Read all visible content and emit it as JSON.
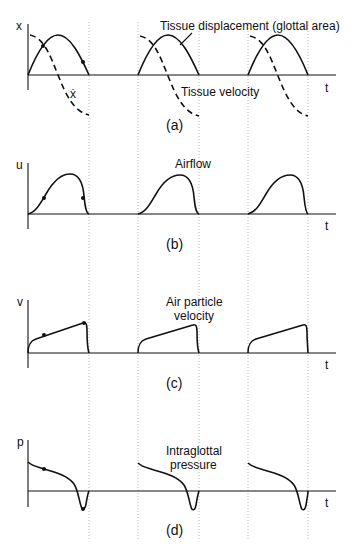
{
  "figure": {
    "panels": [
      {
        "id": "a",
        "caption": "(a)",
        "y_axis_label": "x",
        "x_axis_label": "t",
        "curve_label": "Tissue displacement (glottal area)",
        "secondary_label": "Tissue velocity",
        "secondary_symbol": "ẋ",
        "curves": [
          "tissue-displacement (solid)",
          "tissue-velocity (dashed)"
        ]
      },
      {
        "id": "b",
        "caption": "(b)",
        "y_axis_label": "u",
        "x_axis_label": "t",
        "curve_label": "Airflow"
      },
      {
        "id": "c",
        "caption": "(c)",
        "y_axis_label": "v",
        "x_axis_label": "t",
        "curve_label_line1": "Air particle",
        "curve_label_line2": "velocity"
      },
      {
        "id": "d",
        "caption": "(d)",
        "y_axis_label": "p",
        "x_axis_label": "t",
        "curve_label_line1": "Intraglottal",
        "curve_label_line2": "pressure"
      }
    ],
    "cycles": 3,
    "cycle_boundaries_px": [
      [
        28,
        89
      ],
      [
        138,
        199
      ],
      [
        248,
        308
      ]
    ],
    "colors": {
      "ink": "#111111",
      "guide": "#b8b8b8"
    }
  }
}
